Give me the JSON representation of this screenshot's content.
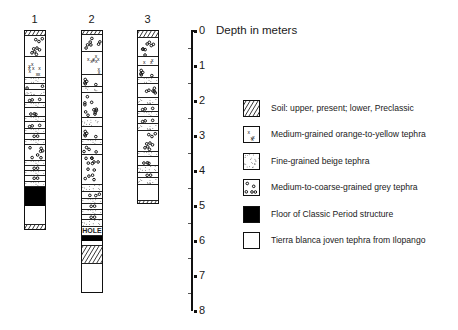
{
  "axis": {
    "title": "Depth in meters",
    "unit": "meters",
    "ticks": [
      "0",
      "1",
      "2",
      "3",
      "4",
      "5",
      "6",
      "7",
      "8"
    ],
    "range": [
      0,
      8
    ]
  },
  "columns": [
    {
      "label": "1",
      "layers": [
        {
          "type": "soil",
          "top": 0.0,
          "bottom": 0.15
        },
        {
          "type": "grey",
          "top": 0.15,
          "bottom": 0.75
        },
        {
          "type": "orange",
          "top": 0.75,
          "bottom": 1.35
        },
        {
          "type": "beige",
          "top": 1.35,
          "bottom": 1.5
        },
        {
          "type": "grey",
          "top": 1.5,
          "bottom": 1.68
        },
        {
          "type": "beige",
          "top": 1.68,
          "bottom": 1.85
        },
        {
          "type": "grey",
          "top": 1.85,
          "bottom": 2.05
        },
        {
          "type": "beige",
          "top": 2.05,
          "bottom": 2.2
        },
        {
          "type": "grey",
          "top": 2.2,
          "bottom": 2.45
        },
        {
          "type": "beige",
          "top": 2.45,
          "bottom": 2.6
        },
        {
          "type": "grey",
          "top": 2.6,
          "bottom": 2.8
        },
        {
          "type": "beige",
          "top": 2.8,
          "bottom": 2.95
        },
        {
          "type": "grey",
          "top": 2.95,
          "bottom": 3.1
        },
        {
          "type": "beige",
          "top": 3.1,
          "bottom": 3.25
        },
        {
          "type": "grey",
          "top": 3.25,
          "bottom": 3.7
        },
        {
          "type": "beige",
          "top": 3.7,
          "bottom": 3.85
        },
        {
          "type": "grey",
          "top": 3.85,
          "bottom": 4.0
        },
        {
          "type": "beige",
          "top": 4.0,
          "bottom": 4.15
        },
        {
          "type": "grey",
          "top": 4.15,
          "bottom": 4.3
        },
        {
          "type": "beige",
          "top": 4.3,
          "bottom": 4.45
        },
        {
          "type": "floor",
          "top": 4.45,
          "bottom": 5.0
        },
        {
          "type": "tbj",
          "top": 5.0,
          "bottom": 5.55
        },
        {
          "type": "soil",
          "top": 5.55,
          "bottom": 5.7
        }
      ]
    },
    {
      "label": "2",
      "layers": [
        {
          "type": "soil",
          "top": 0.0,
          "bottom": 0.12
        },
        {
          "type": "grey",
          "top": 0.12,
          "bottom": 0.6
        },
        {
          "type": "orange",
          "top": 0.6,
          "bottom": 1.25
        },
        {
          "type": "grey",
          "top": 1.25,
          "bottom": 1.6
        },
        {
          "type": "beige",
          "top": 1.6,
          "bottom": 1.78
        },
        {
          "type": "grey",
          "top": 1.78,
          "bottom": 2.5
        },
        {
          "type": "beige",
          "top": 2.5,
          "bottom": 2.75
        },
        {
          "type": "grey",
          "top": 2.75,
          "bottom": 3.1
        },
        {
          "type": "beige",
          "top": 3.1,
          "bottom": 3.25
        },
        {
          "type": "grey",
          "top": 3.25,
          "bottom": 3.55
        },
        {
          "type": "grey",
          "top": 3.55,
          "bottom": 4.4
        },
        {
          "type": "beige",
          "top": 4.4,
          "bottom": 4.6
        },
        {
          "type": "grey",
          "top": 4.6,
          "bottom": 4.8
        },
        {
          "type": "beige",
          "top": 4.8,
          "bottom": 4.95
        },
        {
          "type": "grey",
          "top": 4.95,
          "bottom": 5.1
        },
        {
          "type": "beige",
          "top": 5.1,
          "bottom": 5.25
        },
        {
          "type": "grey",
          "top": 5.25,
          "bottom": 5.4
        },
        {
          "type": "beige",
          "top": 5.4,
          "bottom": 5.6
        },
        {
          "type": "hole",
          "top": 5.6,
          "bottom": 5.85,
          "label": "HOLE"
        },
        {
          "type": "floor",
          "top": 5.85,
          "bottom": 6.0
        },
        {
          "type": "tbj",
          "top": 6.0,
          "bottom": 6.15
        },
        {
          "type": "soil",
          "top": 6.15,
          "bottom": 6.65
        },
        {
          "type": "tbj",
          "top": 6.65,
          "bottom": 7.5
        }
      ]
    },
    {
      "label": "3",
      "layers": [
        {
          "type": "soil",
          "top": 0.0,
          "bottom": 0.2
        },
        {
          "type": "grey",
          "top": 0.2,
          "bottom": 0.75
        },
        {
          "type": "orange",
          "top": 0.75,
          "bottom": 1.0
        },
        {
          "type": "grey",
          "top": 1.0,
          "bottom": 1.35
        },
        {
          "type": "beige",
          "top": 1.35,
          "bottom": 1.5
        },
        {
          "type": "grey",
          "top": 1.5,
          "bottom": 1.9
        },
        {
          "type": "beige",
          "top": 1.9,
          "bottom": 2.1
        },
        {
          "type": "grey",
          "top": 2.1,
          "bottom": 2.3
        },
        {
          "type": "beige",
          "top": 2.3,
          "bottom": 2.45
        },
        {
          "type": "grey",
          "top": 2.45,
          "bottom": 2.65
        },
        {
          "type": "beige",
          "top": 2.65,
          "bottom": 2.85
        },
        {
          "type": "grey",
          "top": 2.85,
          "bottom": 3.45
        },
        {
          "type": "beige",
          "top": 3.45,
          "bottom": 3.6
        },
        {
          "type": "grey",
          "top": 3.6,
          "bottom": 3.85
        },
        {
          "type": "beige",
          "top": 3.85,
          "bottom": 4.05
        },
        {
          "type": "grey",
          "top": 4.05,
          "bottom": 4.2
        },
        {
          "type": "beige",
          "top": 4.2,
          "bottom": 4.4
        },
        {
          "type": "tbj",
          "top": 4.4,
          "bottom": 4.85
        },
        {
          "type": "soil",
          "top": 4.85,
          "bottom": 4.98
        }
      ]
    }
  ],
  "legend": [
    {
      "type": "soil",
      "label": "Soil: upper, present; lower, Preclassic"
    },
    {
      "type": "orange",
      "label": "Medium-grained orange-to-yellow tephra"
    },
    {
      "type": "beige",
      "label": "Fine-grained beige tephra"
    },
    {
      "type": "grey",
      "label": "Medium-to-coarse-grained grey tephra"
    },
    {
      "type": "floor",
      "label": "Floor of Classic Period structure"
    },
    {
      "type": "tbj",
      "label": "Tierra blanca joven tephra from Ilopango"
    }
  ]
}
